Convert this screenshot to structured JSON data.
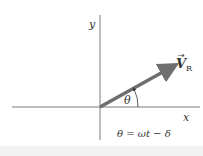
{
  "diagram": {
    "axes": {
      "x_label": "x",
      "y_label": "y",
      "axis_color": "#7a7a7a"
    },
    "vector": {
      "label_main": "V",
      "label_sub": "R",
      "arrow_mark": "→",
      "color": "#6e6e6e"
    },
    "angle": {
      "label": "θ"
    },
    "equation": "θ = ωt − δ"
  }
}
